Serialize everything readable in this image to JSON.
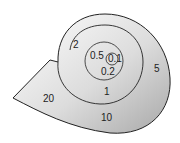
{
  "diagram": {
    "type": "logarithmic spiral",
    "colors": {
      "fill_light": "#f4f4f4",
      "fill_dark": "#b9b9b9",
      "stroke": "#222222"
    },
    "labels": [
      {
        "id": "l01",
        "text": "0.1"
      },
      {
        "id": "l02",
        "text": "0.2"
      },
      {
        "id": "l05",
        "text": "0.5"
      },
      {
        "id": "l1",
        "text": "1"
      },
      {
        "id": "l2",
        "text": "2"
      },
      {
        "id": "l5",
        "text": "5"
      },
      {
        "id": "l10",
        "text": "10"
      },
      {
        "id": "l20",
        "text": "20"
      }
    ]
  }
}
